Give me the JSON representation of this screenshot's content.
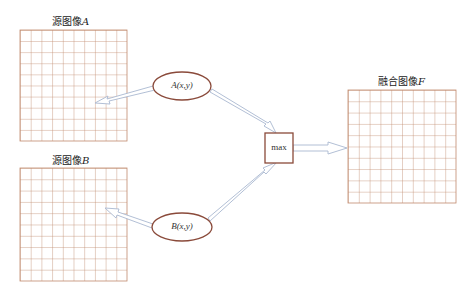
{
  "diagram": {
    "type": "image-fusion-flow",
    "colors": {
      "grid_line": "#c08a6e",
      "node_border": "#8a4a3a",
      "arrow_stroke": "#a9b8d0",
      "arrow_fill": "#ffffff",
      "text": "#222222"
    },
    "source_a": {
      "label_prefix": "源图像",
      "label_var": "A",
      "grid": {
        "x": 20,
        "y": 30,
        "width": 107,
        "height": 111,
        "rows": 10,
        "cols": 10
      }
    },
    "source_b": {
      "label_prefix": "源图像",
      "label_var": "B",
      "grid": {
        "x": 20,
        "y": 168,
        "width": 107,
        "height": 113,
        "rows": 10,
        "cols": 10
      }
    },
    "fused_f": {
      "label_prefix": "融合图像",
      "label_var": "F",
      "grid": {
        "x": 348,
        "y": 90,
        "width": 108,
        "height": 113,
        "rows": 10,
        "cols": 10
      }
    },
    "node_a": {
      "func": "A",
      "args": "(x,y)",
      "cx": 182,
      "cy": 86,
      "rx": 29,
      "ry": 14
    },
    "node_b": {
      "func": "B",
      "args": "(x,y)",
      "cx": 182,
      "cy": 227,
      "rx": 30,
      "ry": 14
    },
    "max_box": {
      "label": "max",
      "x": 265,
      "y": 133,
      "width": 28,
      "height": 30
    },
    "edges": [
      {
        "from": "node_a",
        "to": "source_a"
      },
      {
        "from": "node_b",
        "to": "source_b"
      },
      {
        "from": "node_a",
        "to": "max_box"
      },
      {
        "from": "node_b",
        "to": "max_box"
      },
      {
        "from": "max_box",
        "to": "fused_f"
      }
    ]
  }
}
